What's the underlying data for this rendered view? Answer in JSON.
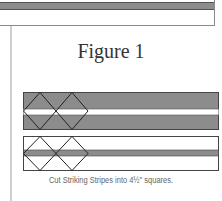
{
  "figure": {
    "title": "Figure 1",
    "caption": "Cut Striking Stripes into 4½\" squares."
  },
  "colors": {
    "band_gray": "#8c8c8c",
    "outline": "#333333",
    "stripe_white": "#ffffff",
    "side_rule": "#cfcfcf"
  },
  "diagrams": [
    {
      "name": "dark-strip",
      "base": "gray",
      "stripe": "white",
      "squares": 2
    },
    {
      "name": "light-strip",
      "base": "white",
      "stripe": "gray",
      "squares": 2
    }
  ]
}
